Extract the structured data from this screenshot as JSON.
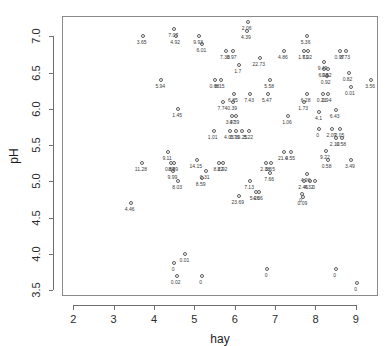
{
  "chart_data": {
    "type": "scatter",
    "title": "",
    "xlabel": "hay",
    "ylabel": "pH",
    "xlim": [
      1.72,
      9.55
    ],
    "ylim": [
      3.42,
      7.28
    ],
    "grid": false,
    "legend": null,
    "xticks": [
      "2",
      "3",
      "4",
      "5",
      "6",
      "7",
      "8",
      "9"
    ],
    "xtick_values": [
      2,
      3,
      4,
      5,
      6,
      7,
      8,
      9
    ],
    "yticks": [
      "3.5",
      "4.0",
      "4.5",
      "5.0",
      "5.5",
      "6.0",
      "6.5",
      "7.0"
    ],
    "ytick_values": [
      3.5,
      4.0,
      4.5,
      5.0,
      5.5,
      6.0,
      6.5,
      7.0
    ],
    "point_label_note": "each point annotated below-left with a numeric value",
    "points": [
      {
        "x": 3.72,
        "y": 7.0,
        "label": "3.65"
      },
      {
        "x": 4.5,
        "y": 7.1,
        "label": "7.07"
      },
      {
        "x": 4.55,
        "y": 7.0,
        "label": "4.92"
      },
      {
        "x": 5.12,
        "y": 7.0,
        "label": "9.93"
      },
      {
        "x": 5.2,
        "y": 6.9,
        "label": "6.01"
      },
      {
        "x": 6.32,
        "y": 7.2,
        "label": "2.06"
      },
      {
        "x": 6.3,
        "y": 7.08,
        "label": "4.39"
      },
      {
        "x": 5.78,
        "y": 6.8,
        "label": "7.38"
      },
      {
        "x": 5.95,
        "y": 6.8,
        "label": "0.97"
      },
      {
        "x": 6.62,
        "y": 6.7,
        "label": "22.73"
      },
      {
        "x": 7.22,
        "y": 6.8,
        "label": "4.86"
      },
      {
        "x": 7.72,
        "y": 6.8,
        "label": "1.61"
      },
      {
        "x": 7.82,
        "y": 6.8,
        "label": "7.92"
      },
      {
        "x": 7.78,
        "y": 7.0,
        "label": "5.36"
      },
      {
        "x": 8.62,
        "y": 6.8,
        "label": "0.97"
      },
      {
        "x": 8.76,
        "y": 6.8,
        "label": "8.73"
      },
      {
        "x": 6.1,
        "y": 6.6,
        "label": "1.7"
      },
      {
        "x": 8.2,
        "y": 6.65,
        "label": "9.49"
      },
      {
        "x": 8.22,
        "y": 6.55,
        "label": "6.98"
      },
      {
        "x": 8.3,
        "y": 6.55,
        "label": "0.92"
      },
      {
        "x": 8.28,
        "y": 6.45,
        "label": "0.92"
      },
      {
        "x": 8.82,
        "y": 6.5,
        "label": "0.82"
      },
      {
        "x": 5.52,
        "y": 6.4,
        "label": "0.68"
      },
      {
        "x": 5.65,
        "y": 6.4,
        "label": "8.15"
      },
      {
        "x": 4.18,
        "y": 6.4,
        "label": "5.94"
      },
      {
        "x": 9.38,
        "y": 6.4,
        "label": "3.56"
      },
      {
        "x": 6.88,
        "y": 6.4,
        "label": "5.58"
      },
      {
        "x": 8.88,
        "y": 6.3,
        "label": "0.01"
      },
      {
        "x": 5.98,
        "y": 6.2,
        "label": "6.85"
      },
      {
        "x": 6.38,
        "y": 6.2,
        "label": "7.43"
      },
      {
        "x": 6.82,
        "y": 6.2,
        "label": "5.47"
      },
      {
        "x": 7.78,
        "y": 6.2,
        "label": "6.28"
      },
      {
        "x": 8.18,
        "y": 6.2,
        "label": "0.21"
      },
      {
        "x": 8.3,
        "y": 6.2,
        "label": "0.94"
      },
      {
        "x": 5.72,
        "y": 6.1,
        "label": "7.74"
      },
      {
        "x": 5.96,
        "y": 6.1,
        "label": "0.39"
      },
      {
        "x": 7.72,
        "y": 6.1,
        "label": "1.73"
      },
      {
        "x": 4.6,
        "y": 6.0,
        "label": "1.45"
      },
      {
        "x": 5.92,
        "y": 5.9,
        "label": "3.47"
      },
      {
        "x": 6.02,
        "y": 5.9,
        "label": "0.39"
      },
      {
        "x": 7.32,
        "y": 5.9,
        "label": "1.06"
      },
      {
        "x": 8.1,
        "y": 5.95,
        "label": "4.1"
      },
      {
        "x": 8.5,
        "y": 5.98,
        "label": "6.43"
      },
      {
        "x": 5.48,
        "y": 5.7,
        "label": "1.01"
      },
      {
        "x": 5.88,
        "y": 5.7,
        "label": "4.05"
      },
      {
        "x": 6.02,
        "y": 5.7,
        "label": "0.76"
      },
      {
        "x": 6.18,
        "y": 5.7,
        "label": "19.25"
      },
      {
        "x": 6.36,
        "y": 5.7,
        "label": "5.22"
      },
      {
        "x": 8.08,
        "y": 5.72,
        "label": "0"
      },
      {
        "x": 8.42,
        "y": 5.72,
        "label": "2.09"
      },
      {
        "x": 8.62,
        "y": 5.72,
        "label": "2.05"
      },
      {
        "x": 8.5,
        "y": 5.6,
        "label": "2.10"
      },
      {
        "x": 8.66,
        "y": 5.6,
        "label": "0.58"
      },
      {
        "x": 4.35,
        "y": 5.4,
        "label": "9.11"
      },
      {
        "x": 7.22,
        "y": 5.4,
        "label": "21.4"
      },
      {
        "x": 7.4,
        "y": 5.4,
        "label": "0.55"
      },
      {
        "x": 8.26,
        "y": 5.42,
        "label": "9.22"
      },
      {
        "x": 8.3,
        "y": 5.3,
        "label": "0.58"
      },
      {
        "x": 5.06,
        "y": 5.3,
        "label": "14.15"
      },
      {
        "x": 3.7,
        "y": 5.25,
        "label": "11.28"
      },
      {
        "x": 4.42,
        "y": 5.25,
        "label": "0.89"
      },
      {
        "x": 4.5,
        "y": 5.25,
        "label": "8.89"
      },
      {
        "x": 5.62,
        "y": 5.25,
        "label": "8.22"
      },
      {
        "x": 5.72,
        "y": 5.25,
        "label": "8.92"
      },
      {
        "x": 6.78,
        "y": 5.25,
        "label": "2.38"
      },
      {
        "x": 6.9,
        "y": 5.25,
        "label": "0.65"
      },
      {
        "x": 8.88,
        "y": 5.3,
        "label": "3.49"
      },
      {
        "x": 4.48,
        "y": 5.15,
        "label": "9.99"
      },
      {
        "x": 5.28,
        "y": 5.15,
        "label": "0.31"
      },
      {
        "x": 6.88,
        "y": 5.12,
        "label": "7.66"
      },
      {
        "x": 7.78,
        "y": 5.1,
        "label": "4.96"
      },
      {
        "x": 5.18,
        "y": 5.05,
        "label": "8.59"
      },
      {
        "x": 4.6,
        "y": 5.0,
        "label": "8.03"
      },
      {
        "x": 6.38,
        "y": 5.0,
        "label": "7.13"
      },
      {
        "x": 7.72,
        "y": 5.0,
        "label": "2.45"
      },
      {
        "x": 7.86,
        "y": 5.0,
        "label": "4.32"
      },
      {
        "x": 7.98,
        "y": 5.0,
        "label": "0"
      },
      {
        "x": 6.52,
        "y": 4.85,
        "label": "5.26"
      },
      {
        "x": 6.6,
        "y": 4.85,
        "label": "4.06"
      },
      {
        "x": 7.66,
        "y": 4.82,
        "label": "0"
      },
      {
        "x": 7.7,
        "y": 4.78,
        "label": "0.09"
      },
      {
        "x": 6.1,
        "y": 4.8,
        "label": "23.69"
      },
      {
        "x": 3.42,
        "y": 4.7,
        "label": "4.46"
      },
      {
        "x": 4.78,
        "y": 4.0,
        "label": "0.01"
      },
      {
        "x": 4.5,
        "y": 3.88,
        "label": "0"
      },
      {
        "x": 4.56,
        "y": 3.7,
        "label": "0.02"
      },
      {
        "x": 5.18,
        "y": 3.7,
        "label": "0"
      },
      {
        "x": 6.8,
        "y": 3.79,
        "label": "0"
      },
      {
        "x": 8.5,
        "y": 3.79,
        "label": "0"
      },
      {
        "x": 9.02,
        "y": 3.6,
        "label": "0"
      }
    ]
  },
  "plot_geometry": {
    "frame_left": 62,
    "frame_top": 16,
    "frame_width": 316,
    "frame_height": 280
  }
}
